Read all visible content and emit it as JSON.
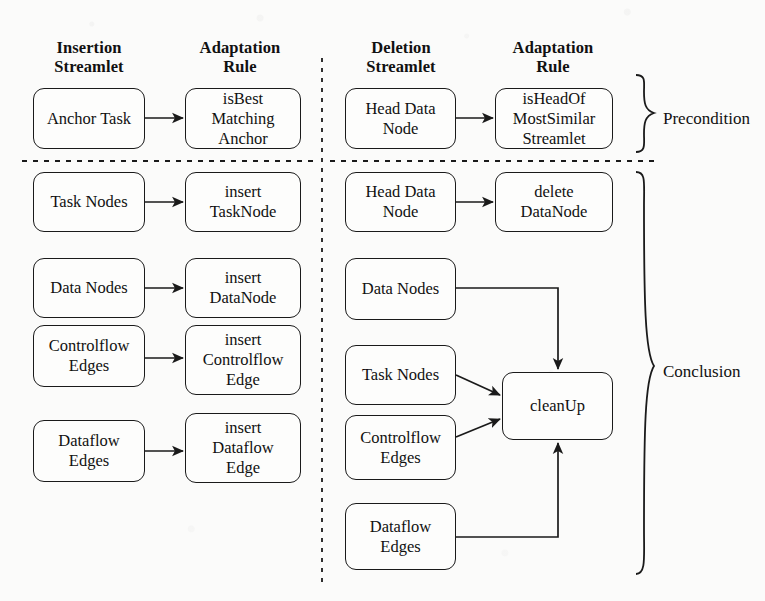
{
  "figure": {
    "columns": [
      {
        "id": "insertion-streamlet",
        "title": "Insertion\nStreamlet"
      },
      {
        "id": "insertion-adaptation-rule",
        "title": "Adaptation\nRule"
      },
      {
        "id": "deletion-streamlet",
        "title": "Deletion\nStreamlet"
      },
      {
        "id": "deletion-adaptation-rule",
        "title": "Adaptation\nRule"
      }
    ],
    "sections": [
      {
        "id": "precondition",
        "label": "Precondition"
      },
      {
        "id": "conclusion",
        "label": "Conclusion"
      }
    ],
    "insertion": {
      "precondition": [
        {
          "streamlet": "Anchor Task",
          "rule": "isBest\nMatching\nAnchor"
        }
      ],
      "conclusion": [
        {
          "streamlet": "Task Nodes",
          "rule": "insert\nTaskNode"
        },
        {
          "streamlet": "Data Nodes",
          "rule": "insert\nDataNode"
        },
        {
          "streamlet": "Controlflow\nEdges",
          "rule": "insert\nControlflow\nEdge"
        },
        {
          "streamlet": "Dataflow\nEdges",
          "rule": "insert\nDataflow\nEdge"
        }
      ]
    },
    "deletion": {
      "precondition": [
        {
          "streamlet": "Head Data\nNode",
          "rule": "isHeadOf\nMostSimilar\nStreamlet"
        }
      ],
      "conclusion": [
        {
          "streamlet": "Head Data\nNode",
          "rule": "delete\nDataNode"
        },
        {
          "streamlet": "Data Nodes",
          "rule": ""
        },
        {
          "streamlet": "Task Nodes",
          "rule": ""
        },
        {
          "streamlet": "Controlflow\nEdges",
          "rule": ""
        },
        {
          "streamlet": "Dataflow\nEdges",
          "rule": ""
        }
      ],
      "shared_rule": "cleanUp"
    },
    "colors": {
      "stroke": "#1a1a1a",
      "background": "#fbfbfa",
      "node_fill": "#fdfdfc"
    }
  }
}
